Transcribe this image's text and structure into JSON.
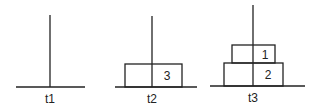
{
  "diagram": {
    "title": "",
    "towers": [
      {
        "label": "t1",
        "disks": []
      },
      {
        "label": "t2",
        "disks": [
          {
            "number": "3"
          }
        ]
      },
      {
        "label": "t3",
        "disks": [
          {
            "number": "1"
          },
          {
            "number": "2"
          }
        ]
      }
    ]
  }
}
